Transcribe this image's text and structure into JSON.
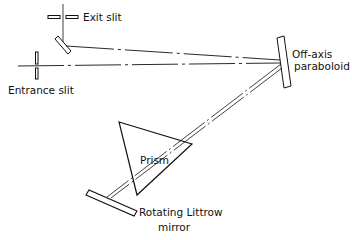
{
  "diagram": {
    "type": "optical-schematic",
    "labels": {
      "exit_slit": "Exit slit",
      "entrance_slit": "Entrance slit",
      "paraboloid_line1": "Off-axis",
      "paraboloid_line2": "paraboloid",
      "prism": "Prism",
      "littrow_line1": "Rotating  Littrow",
      "littrow_line2": "mirror"
    },
    "colors": {
      "ink": "#111111",
      "background": "#ffffff"
    }
  }
}
